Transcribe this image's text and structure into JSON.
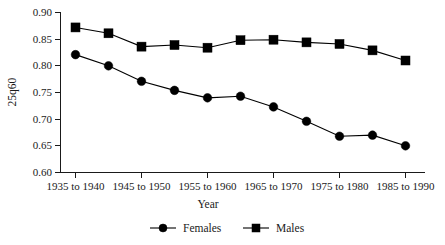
{
  "chart_data": {
    "type": "line",
    "title": "",
    "xlabel": "Year",
    "ylabel": "25q60",
    "categories": [
      "1935 to 1940",
      "1940 to 1945",
      "1945 to 1950",
      "1950 to 1955",
      "1955 to 1960",
      "1960 to 1965",
      "1965 to 1970",
      "1970 to 1975",
      "1975 to 1980",
      "1980 to 1985",
      "1985 to 1990"
    ],
    "xtick_labels": [
      "1935 to 1940",
      "1945 to 1950",
      "1955 to 1960",
      "1965 to 1970",
      "1975 to 1980",
      "1985 to 1990"
    ],
    "ytick_labels": [
      "0.90",
      "0.85",
      "0.80",
      "0.75",
      "0.70",
      "0.65",
      "0.60"
    ],
    "ylim": [
      0.6,
      0.9
    ],
    "ytick_values": [
      0.9,
      0.85,
      0.8,
      0.75,
      0.7,
      0.65,
      0.6
    ],
    "grid": false,
    "legend_position": "bottom",
    "series": [
      {
        "name": "Females",
        "marker": "circle",
        "color": "#000000",
        "values": [
          0.821,
          0.8,
          0.771,
          0.754,
          0.74,
          0.743,
          0.723,
          0.696,
          0.668,
          0.67,
          0.65
        ]
      },
      {
        "name": "Males",
        "marker": "square",
        "color": "#000000",
        "values": [
          0.872,
          0.861,
          0.836,
          0.839,
          0.834,
          0.848,
          0.849,
          0.844,
          0.841,
          0.829,
          0.81
        ]
      }
    ]
  },
  "legend": {
    "items": [
      {
        "label": "Females",
        "marker": "circle"
      },
      {
        "label": "Males",
        "marker": "square"
      }
    ]
  },
  "axes": {
    "y_title": "25q60",
    "x_title": "Year"
  }
}
